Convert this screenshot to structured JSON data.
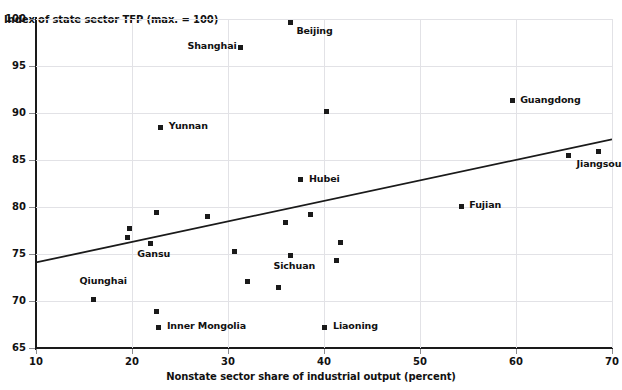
{
  "chart_data": {
    "type": "scatter",
    "title": "",
    "xlabel": "Nonstate sector share of industrial output (percent)",
    "ylabel": "Index of state sector TFP (max. = 100)",
    "xlim": [
      10,
      70
    ],
    "ylim": [
      65,
      100
    ],
    "xticks": [
      10,
      20,
      30,
      40,
      50,
      60,
      70
    ],
    "yticks": [
      65,
      70,
      75,
      80,
      85,
      90,
      95,
      100
    ],
    "grid": true,
    "legend": "none",
    "points": [
      {
        "label": "Beijing",
        "x": 36.5,
        "y": 99.6,
        "label_dx": 6,
        "label_dy": 12
      },
      {
        "label": "Shanghai",
        "x": 31.3,
        "y": 97.0,
        "label_dx": -53,
        "label_dy": 3
      },
      {
        "label": "Guangdong",
        "x": 59.6,
        "y": 91.3,
        "label_dx": 8,
        "label_dy": 3
      },
      {
        "label": "",
        "x": 40.3,
        "y": 90.2,
        "label_dx": 0,
        "label_dy": 0
      },
      {
        "label": "Yunnan",
        "x": 23.0,
        "y": 88.5,
        "label_dx": 8,
        "label_dy": 3
      },
      {
        "label": "",
        "x": 65.5,
        "y": 85.5,
        "label_dx": 0,
        "label_dy": 0
      },
      {
        "label": "Jiangsou",
        "x": 68.6,
        "y": 85.9,
        "label_dx": -22,
        "label_dy": 16
      },
      {
        "label": "Hubei",
        "x": 37.6,
        "y": 82.9,
        "label_dx": 8,
        "label_dy": 3
      },
      {
        "label": "Fujian",
        "x": 54.3,
        "y": 80.1,
        "label_dx": 8,
        "label_dy": 3
      },
      {
        "label": "",
        "x": 38.6,
        "y": 79.2,
        "label_dx": 0,
        "label_dy": 0
      },
      {
        "label": "",
        "x": 27.9,
        "y": 79.0,
        "label_dx": 0,
        "label_dy": 0
      },
      {
        "label": "",
        "x": 22.6,
        "y": 79.4,
        "label_dx": 0,
        "label_dy": 0
      },
      {
        "label": "",
        "x": 36.0,
        "y": 78.3,
        "label_dx": 0,
        "label_dy": 0
      },
      {
        "label": "",
        "x": 19.7,
        "y": 77.7,
        "label_dx": 0,
        "label_dy": 0
      },
      {
        "label": "",
        "x": 19.5,
        "y": 76.8,
        "label_dx": 0,
        "label_dy": 0
      },
      {
        "label": "Gansu",
        "x": 21.9,
        "y": 76.1,
        "label_dx": -13,
        "label_dy": 14
      },
      {
        "label": "",
        "x": 41.7,
        "y": 76.2,
        "label_dx": 0,
        "label_dy": 0
      },
      {
        "label": "",
        "x": 30.7,
        "y": 75.3,
        "label_dx": 0,
        "label_dy": 0
      },
      {
        "label": "",
        "x": 41.3,
        "y": 74.3,
        "label_dx": 0,
        "label_dy": 0
      },
      {
        "label": "Sichuan",
        "x": 36.5,
        "y": 74.8,
        "label_dx": -17,
        "label_dy": 14
      },
      {
        "label": "",
        "x": 32.0,
        "y": 72.1,
        "label_dx": 0,
        "label_dy": 0
      },
      {
        "label": "",
        "x": 35.3,
        "y": 71.4,
        "label_dx": 0,
        "label_dy": 0
      },
      {
        "label": "Qiunghai",
        "x": 16.0,
        "y": 70.2,
        "label_dx": -14,
        "label_dy": -14
      },
      {
        "label": "",
        "x": 22.5,
        "y": 68.9,
        "label_dx": 0,
        "label_dy": 0
      },
      {
        "label": "Inner Mongolia",
        "x": 22.8,
        "y": 67.2,
        "label_dx": 8,
        "label_dy": 3
      },
      {
        "label": "Liaoning",
        "x": 40.1,
        "y": 67.2,
        "label_dx": 8,
        "label_dy": 3
      }
    ],
    "trendline": {
      "x0": 10,
      "y0": 74.1,
      "x1": 70,
      "y1": 87.2
    },
    "marker_color": "#1a1a1a",
    "grid_color": "#e2e2e6",
    "axis_color": "#1a1a1a"
  }
}
